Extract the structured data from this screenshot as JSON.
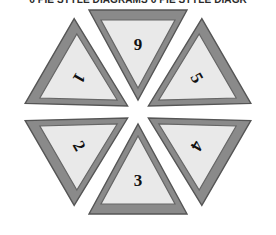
{
  "title": {
    "text": "6 PIE STYLE DIAGRAMS 6 PIE STYLE DIAGR"
  },
  "figure": {
    "name": "six-triangle-pie-wheel",
    "shape": "hexagonal-wheel",
    "segment_count": 6,
    "colors": {
      "background": "#ffffff",
      "band_fill": "#8a8a8a",
      "band_stroke": "#555555",
      "inner_fill": "#e9e9e9",
      "inner_stroke": "#666666",
      "label_color": "#111111"
    },
    "segments": [
      {
        "id": "segment-top",
        "label": "9",
        "position": "top",
        "direction": "points-down",
        "rotation_deg": 0,
        "label_x": 138,
        "label_y": 42
      },
      {
        "id": "segment-upper-right",
        "label": "5",
        "position": "upper-right",
        "direction": "points-left",
        "rotation_deg": -60,
        "label_x": 198,
        "label_y": 73
      },
      {
        "id": "segment-lower-right",
        "label": "4",
        "position": "lower-right",
        "direction": "points-left-down",
        "rotation_deg": -120,
        "label_x": 198,
        "label_y": 153
      },
      {
        "id": "segment-bottom",
        "label": "3",
        "position": "bottom",
        "direction": "points-up",
        "rotation_deg": 180,
        "label_x": 138,
        "label_y": 186
      },
      {
        "id": "segment-lower-left",
        "label": "2",
        "position": "lower-left",
        "direction": "points-right-down",
        "rotation_deg": 120,
        "label_x": 72,
        "label_y": 153
      },
      {
        "id": "segment-upper-left",
        "label": "1",
        "position": "upper-left",
        "direction": "points-right",
        "rotation_deg": 60,
        "label_x": 72,
        "label_y": 73
      }
    ]
  }
}
